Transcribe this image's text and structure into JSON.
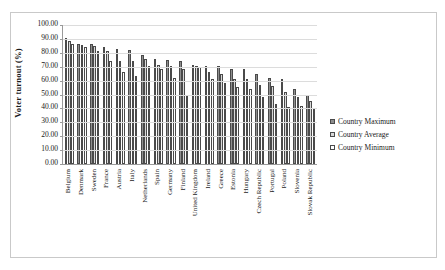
{
  "chart_data": {
    "type": "bar",
    "title": "",
    "xlabel": "",
    "ylabel": "Voter turnout (%)",
    "ylim": [
      0,
      100
    ],
    "ytick_labels": [
      "100.00",
      "90.00",
      "80.00",
      "70.00",
      "60.00",
      "50.00",
      "40.00",
      "30.00",
      "20.00",
      "10.00",
      "0.00"
    ],
    "yticks": [
      100,
      90,
      80,
      70,
      60,
      50,
      40,
      30,
      20,
      10,
      0
    ],
    "grid": true,
    "legend_position": "right",
    "categories": [
      "Belgium",
      "Denmark",
      "Sweden",
      "France",
      "Austria",
      "Italy",
      "Netherlands",
      "Spain",
      "Germany",
      "Finland",
      "United Kingdom",
      "Ireland",
      "Greece",
      "Estonia",
      "Hungary",
      "Czech Republic",
      "Portugal",
      "Poland",
      "Slovenia",
      "Slovak Republic"
    ],
    "series": [
      {
        "name": "Country Maximum",
        "values": [
          90.8,
          86.4,
          86.2,
          84.2,
          82.7,
          82.2,
          78.3,
          75.7,
          74.5,
          74.1,
          71.0,
          70.5,
          70.3,
          68.0,
          68.0,
          64.5,
          62.0,
          61.0,
          54.0,
          50.0
        ]
      },
      {
        "name": "Country Average",
        "values": [
          88.5,
          85.5,
          85.0,
          81.4,
          74.3,
          74.0,
          75.5,
          71.3,
          70.5,
          68.0,
          70.4,
          66.0,
          65.0,
          61.5,
          61.0,
          57.0,
          56.0,
          52.0,
          48.0,
          45.0
        ]
      },
      {
        "name": "Country Minimum",
        "values": [
          86.3,
          84.2,
          81.3,
          73.8,
          66.0,
          63.0,
          70.7,
          68.0,
          62.0,
          49.5,
          69.8,
          61.0,
          58.5,
          55.5,
          54.0,
          48.0,
          43.0,
          41.0,
          42.0,
          39.5
        ]
      }
    ],
    "legend": [
      "Country Maximum",
      "Country Average",
      "Country Minimum"
    ],
    "colors": {
      "series0": "#8e8e8e",
      "series1": "#d8d8d8",
      "series2": "#ffffff",
      "axis": "#9a9a9a",
      "grid": "#dcdcdc"
    }
  }
}
